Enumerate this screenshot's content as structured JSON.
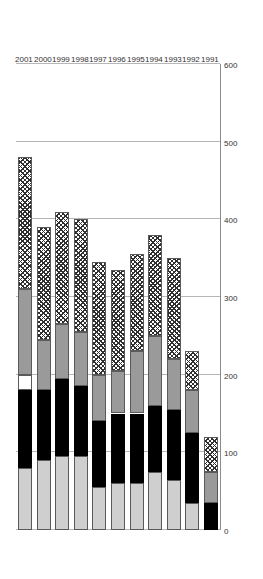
{
  "chart_data": {
    "type": "bar",
    "orientation": "horizontal-stacked",
    "title": "",
    "xlabel": "",
    "ylabel": "",
    "xlim": [
      0,
      600
    ],
    "xticks": [
      0,
      100,
      200,
      300,
      400,
      500,
      600
    ],
    "grid": true,
    "legend_position": "top-right",
    "categories": [
      "1991",
      "1992",
      "1993",
      "1994",
      "1995",
      "1996",
      "1997",
      "1998",
      "1999",
      "2000",
      "2001"
    ],
    "series": [
      {
        "name": "Chemistry",
        "color": "#cfcfcf",
        "values": [
          0,
          35,
          65,
          75,
          60,
          60,
          55,
          95,
          95,
          90,
          80
        ]
      },
      {
        "name": "Biology",
        "color": "#000000",
        "values": [
          35,
          90,
          90,
          85,
          90,
          90,
          85,
          90,
          100,
          90,
          100
        ]
      },
      {
        "name": "Math",
        "color": "#ffffff",
        "values": [
          0,
          0,
          0,
          0,
          0,
          0,
          0,
          0,
          0,
          0,
          20
        ]
      },
      {
        "name": "Physics",
        "color": "#9a9a9a",
        "values": [
          40,
          55,
          65,
          90,
          80,
          55,
          60,
          70,
          70,
          65,
          110
        ]
      },
      {
        "name": "Engin.",
        "color": "#2f2f2f",
        "values": [
          45,
          50,
          130,
          130,
          125,
          130,
          145,
          145,
          145,
          145,
          170
        ]
      }
    ],
    "totals": [
      120,
      230,
      350,
      380,
      355,
      335,
      345,
      400,
      410,
      390,
      480
    ]
  },
  "legend": {
    "items": [
      {
        "label": "Chemistry",
        "swatch": "light-gray"
      },
      {
        "label": "Biology",
        "swatch": "black"
      },
      {
        "label": "Math",
        "swatch": "white"
      },
      {
        "label": "Physics",
        "swatch": "gray"
      },
      {
        "label": "Engin.",
        "swatch": "hatched"
      }
    ]
  },
  "axis": {
    "tick_labels": [
      "0",
      "100",
      "200",
      "300",
      "400",
      "500",
      "600"
    ],
    "year_labels": [
      "1991",
      "1992",
      "1993",
      "1994",
      "1995",
      "1996",
      "1997",
      "1998",
      "1999",
      "2000",
      "2001"
    ]
  }
}
